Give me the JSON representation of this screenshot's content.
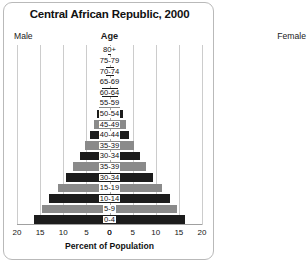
{
  "chart_data": {
    "type": "bar",
    "subtype": "population-pyramid",
    "title": "Central African Republic, 2000",
    "xlabel": "Percent of Population",
    "ylabel": "Age",
    "left_series_label": "Male",
    "right_series_label": "Female",
    "categories": [
      "80+",
      "75-79",
      "70-74",
      "65-69",
      "60-64",
      "55-59",
      "50-54",
      "45-49",
      "40-44",
      "35-39",
      "30-34",
      "35-39",
      "30-34",
      "15-19",
      "10-14",
      "5-9",
      "0-4"
    ],
    "series": [
      {
        "name": "Male",
        "values": [
          0.3,
          0.5,
          0.8,
          1.2,
          1.7,
          2.2,
          2.8,
          3.4,
          4.2,
          5.2,
          6.4,
          7.8,
          9.4,
          11.2,
          13.0,
          14.6,
          16.3
        ]
      },
      {
        "name": "Female",
        "values": [
          0.4,
          0.6,
          0.9,
          1.3,
          1.8,
          2.3,
          2.9,
          3.5,
          4.3,
          5.3,
          6.5,
          7.9,
          9.5,
          11.3,
          13.1,
          14.7,
          16.4
        ]
      }
    ],
    "xlim": [
      0,
      20
    ],
    "xticks": [
      20,
      15,
      10,
      5,
      0,
      0,
      5,
      10,
      15,
      20
    ],
    "grid": true,
    "legend": "none",
    "bar_colors": [
      "#1c1c1c",
      "#8a8a8a"
    ],
    "colors": {
      "bar_dark": "#1c1c1c",
      "bar_gray": "#8a8a8a",
      "gridline": "#cccccc",
      "axis": "#a8a8a8",
      "border": "#b9b9b9",
      "text": "#111111",
      "background": "#ffffff"
    }
  },
  "header": {
    "title": "Central African Republic, 2000",
    "male": "Male",
    "female": "Female",
    "age": "Age"
  },
  "axis": {
    "xlabel": "Percent of Population"
  }
}
